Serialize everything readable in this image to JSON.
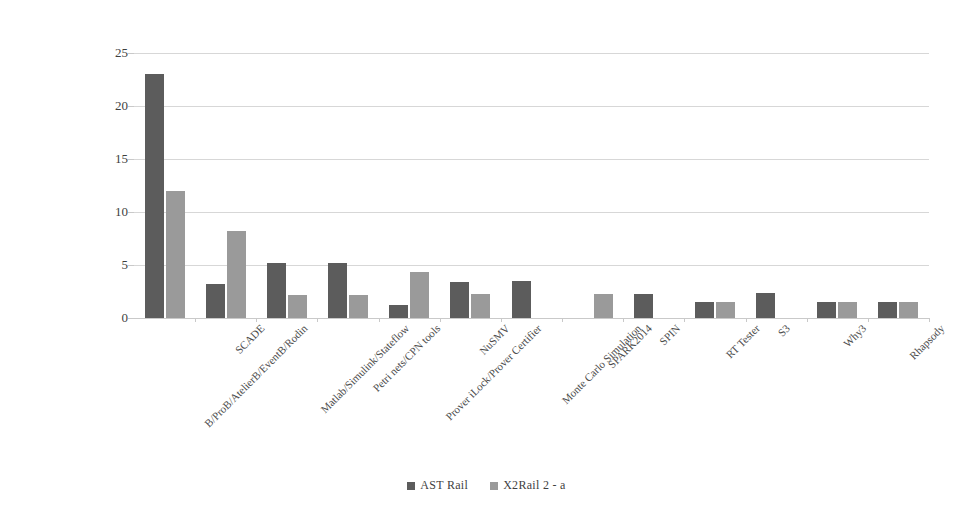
{
  "chart_data": {
    "type": "bar",
    "title": "",
    "subtitle": "",
    "xlabel": "",
    "ylabel": "",
    "ylim": [
      0,
      25
    ],
    "ytick_labels": [
      "25",
      "20",
      "15",
      "10",
      "5",
      "0"
    ],
    "ytick_values": [
      25,
      20,
      15,
      10,
      5,
      0
    ],
    "grid": true,
    "legend_position": "bottom-center",
    "categories": [
      "B/ProB/AtelierB/EventB/Rodin",
      "SCADE",
      "Matlab/Simulink/Stateflow",
      "Petri nets/CPN tools",
      "Prover iLock/Prover Certifier",
      "NuSMV",
      "Monte Carlo Simulation",
      "SPARK2014",
      "SPIN",
      "RT Tester",
      "S3",
      "Why3",
      "Rhapsody"
    ],
    "series": [
      {
        "name": "AST Rail",
        "color": "#5c5c5c",
        "values": [
          23,
          3.2,
          5.2,
          5.2,
          1.2,
          3.4,
          3.5,
          0,
          2.3,
          1.5,
          2.4,
          1.5,
          1.5
        ]
      },
      {
        "name": "X2Rail 2 - a",
        "color": "#9a9a9a",
        "values": [
          12,
          8.2,
          2.2,
          2.2,
          4.3,
          2.3,
          0,
          2.3,
          0,
          1.5,
          0,
          1.5,
          1.5
        ]
      }
    ]
  },
  "legend": {
    "entries": [
      {
        "label": "AST Rail",
        "color": "#5c5c5c"
      },
      {
        "label": "X2Rail 2 - a",
        "color": "#9a9a9a"
      }
    ]
  },
  "colors": {
    "series_dark": "#5c5c5c",
    "series_light": "#9a9a9a",
    "gridline": "#d7d7d7",
    "text": "#3f3f3f",
    "background": "#ffffff"
  }
}
